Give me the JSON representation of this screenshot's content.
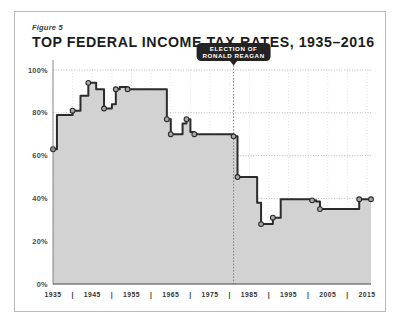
{
  "figure": {
    "number_label": "Figure 5",
    "title": "TOP FEDERAL INCOME TAX RATES, 1935–2016"
  },
  "colors": {
    "frame_border": "#b9b9b9",
    "area_fill": "#d2d2d2",
    "line": "#2b2b2b",
    "marker_fill": "#a8a8a8",
    "marker_stroke": "#2b2b2b",
    "gridline": "#9a9a9a",
    "annotation_bg": "#232323",
    "annotation_text": "#ffffff",
    "axis_text": "#4a4a4a",
    "background": "#ffffff"
  },
  "annotation": {
    "line1": "ELECTION OF",
    "line2": "RONALD REAGAN",
    "marker_year": 1981
  },
  "chart_data": {
    "type": "area",
    "title": "TOP FEDERAL INCOME TAX RATES, 1935–2016",
    "subtitle": "Figure 5",
    "xlabel": "",
    "ylabel": "",
    "xlim": [
      1935,
      2016
    ],
    "ylim": [
      0,
      100
    ],
    "grid": true,
    "legend": false,
    "ytick_labels": [
      "0%",
      "20%",
      "40%",
      "60%",
      "80%",
      "100%"
    ],
    "ytick_values": [
      0,
      20,
      40,
      60,
      80,
      100
    ],
    "xtick_labels": [
      "1935",
      "1945",
      "1955",
      "1965",
      "1975",
      "1985",
      "1995",
      "2005",
      "2015"
    ],
    "xtick_values": [
      1935,
      1945,
      1955,
      1965,
      1975,
      1985,
      1995,
      2005,
      2015
    ],
    "xminor_values": [
      1940,
      1950,
      1960,
      1970,
      1980,
      1990,
      2000,
      2010
    ],
    "series_name": "Top federal income tax rate",
    "x": [
      1935,
      1936,
      1940,
      1941,
      1942,
      1944,
      1946,
      1948,
      1950,
      1951,
      1952,
      1954,
      1964,
      1965,
      1968,
      1969,
      1970,
      1971,
      1981,
      1982,
      1987,
      1988,
      1991,
      1993,
      2001,
      2002,
      2003,
      2013,
      2016
    ],
    "y": [
      63,
      79,
      81,
      81,
      88,
      94,
      91,
      82,
      84,
      91,
      92,
      91,
      77,
      70,
      75,
      77,
      71,
      70,
      69,
      50,
      38,
      28,
      31,
      39.6,
      39.1,
      38.6,
      35,
      39.6,
      39.6
    ],
    "annotations": [
      {
        "text": "ELECTION OF RONALD REAGAN",
        "x": 1981,
        "y": 100
      }
    ],
    "markers_x": [
      1935,
      1940,
      1944,
      1948,
      1951,
      1954,
      1964,
      1965,
      1969,
      1971,
      1981,
      1982,
      1988,
      1991,
      2001,
      2003,
      2013,
      2016
    ],
    "markers_y": [
      63,
      81,
      94,
      82,
      91,
      91,
      77,
      70,
      77,
      70,
      69,
      50,
      28,
      31,
      39.1,
      35,
      39.6,
      39.6
    ]
  }
}
